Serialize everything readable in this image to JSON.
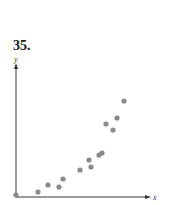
{
  "problem_number": "35.",
  "chart_data": {
    "type": "scatter",
    "title": "",
    "xlabel": "x",
    "ylabel": "y",
    "grid": false,
    "points": [
      {
        "x": 0,
        "y": 0
      },
      {
        "x": 22,
        "y": 3
      },
      {
        "x": 32,
        "y": 10
      },
      {
        "x": 43,
        "y": 8
      },
      {
        "x": 47,
        "y": 16
      },
      {
        "x": 64,
        "y": 25
      },
      {
        "x": 73,
        "y": 35
      },
      {
        "x": 75,
        "y": 28
      },
      {
        "x": 83,
        "y": 40
      },
      {
        "x": 86,
        "y": 42
      },
      {
        "x": 90,
        "y": 71
      },
      {
        "x": 97,
        "y": 65
      },
      {
        "x": 101,
        "y": 77
      },
      {
        "x": 108,
        "y": 94
      }
    ],
    "colors": {
      "point": "#8a8a8a",
      "axis": "#333333"
    }
  }
}
